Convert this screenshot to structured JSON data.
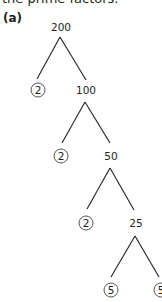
{
  "caption": "the prime factors.",
  "part_label": "(a)",
  "tree": {
    "root": "200",
    "nodes": [
      {
        "value": "200",
        "type": "composite"
      },
      {
        "value": "2",
        "type": "prime"
      },
      {
        "value": "100",
        "type": "composite"
      },
      {
        "value": "2",
        "type": "prime"
      },
      {
        "value": "50",
        "type": "composite"
      },
      {
        "value": "2",
        "type": "prime"
      },
      {
        "value": "25",
        "type": "composite"
      },
      {
        "value": "5",
        "type": "prime"
      },
      {
        "value": "5",
        "type": "prime"
      }
    ],
    "edges": [
      [
        "200",
        "2"
      ],
      [
        "200",
        "100"
      ],
      [
        "100",
        "2"
      ],
      [
        "100",
        "50"
      ],
      [
        "50",
        "2"
      ],
      [
        "50",
        "25"
      ],
      [
        "25",
        "5"
      ],
      [
        "25",
        "5"
      ]
    ],
    "prime_factors": [
      "2",
      "2",
      "2",
      "5",
      "5"
    ]
  }
}
